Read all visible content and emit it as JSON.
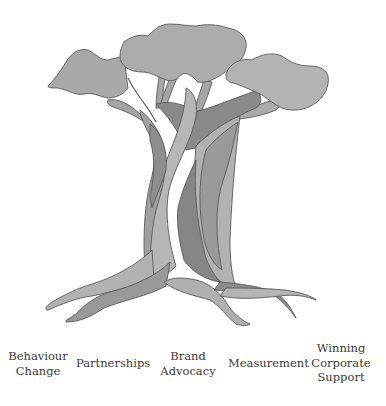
{
  "diagram": {
    "type": "tree-illustration",
    "colors": {
      "canopy": "#a9a9a9",
      "canopy_light": "#b4b4b4",
      "trunk_light": "#b0b0b0",
      "trunk_mid": "#9a9a9a",
      "trunk_dark": "#828282",
      "outline": "#5a5a5a"
    },
    "labels": [
      {
        "text": "Behaviour\nChange"
      },
      {
        "text": "Partnerships"
      },
      {
        "text": "Brand\nAdvocacy"
      },
      {
        "text": "Measurement"
      },
      {
        "text": "Winning\nCorporate\nSupport"
      }
    ]
  }
}
